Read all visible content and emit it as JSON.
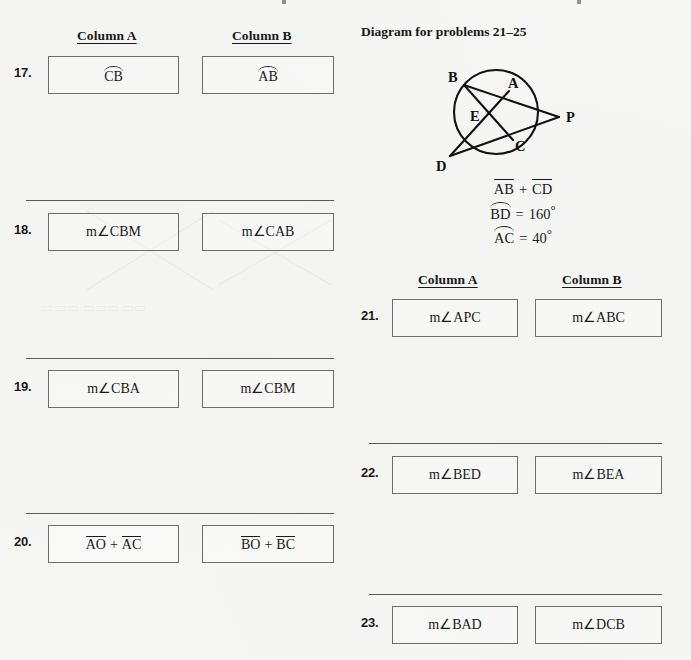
{
  "page": {
    "background_color": "#f6f6f4",
    "text_color": "#1a1a1a",
    "box_border_color": "#6d6d6d",
    "rule_color": "#5a5a5a"
  },
  "left_column": {
    "headers": {
      "column_a": "Column A",
      "column_b": "Column B"
    },
    "problems": [
      {
        "number": "17.",
        "column_a": {
          "notation": "arc",
          "text": "CB"
        },
        "column_b": {
          "notation": "arc",
          "text": "AB"
        }
      },
      {
        "number": "18.",
        "column_a": {
          "notation": "none",
          "text": "m∠CBM"
        },
        "column_b": {
          "notation": "none",
          "text": "m∠CAB"
        }
      },
      {
        "number": "19.",
        "column_a": {
          "notation": "none",
          "text": "m∠CBA"
        },
        "column_b": {
          "notation": "none",
          "text": "m∠CBM"
        }
      },
      {
        "number": "20.",
        "column_a": {
          "notation": "sum-overbar",
          "term1": "AO",
          "operator": "+",
          "term2": "AC"
        },
        "column_b": {
          "notation": "sum-overbar",
          "term1": "BO",
          "operator": "+",
          "term2": "BC"
        }
      }
    ]
  },
  "right_column": {
    "diagram": {
      "title": "Diagram for problems 21–25",
      "point_labels": [
        "B",
        "A",
        "P",
        "E",
        "C",
        "D"
      ],
      "facts": [
        {
          "notation": "sum-overbar",
          "term1": "AB",
          "operator": "+",
          "term2": "CD"
        },
        {
          "notation": "arc",
          "name": "BD",
          "equals": "=",
          "value": "160",
          "unit": "°"
        },
        {
          "notation": "arc",
          "name": "AC",
          "equals": "=",
          "value": "40",
          "unit": "°"
        }
      ]
    },
    "headers": {
      "column_a": "Column A",
      "column_b": "Column B"
    },
    "problems": [
      {
        "number": "21.",
        "column_a": {
          "notation": "none",
          "text": "m∠APC"
        },
        "column_b": {
          "notation": "none",
          "text": "m∠ABC"
        }
      },
      {
        "number": "22.",
        "column_a": {
          "notation": "none",
          "text": "m∠BED"
        },
        "column_b": {
          "notation": "none",
          "text": "m∠BEA"
        }
      },
      {
        "number": "23.",
        "column_a": {
          "notation": "none",
          "text": "m∠BAD"
        },
        "column_b": {
          "notation": "none",
          "text": "m∠DCB"
        }
      }
    ]
  }
}
